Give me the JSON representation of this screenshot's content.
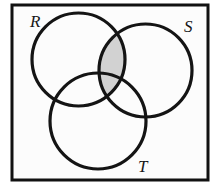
{
  "figure": {
    "kind": "venn-diagram",
    "background_color": "#fcfcfc",
    "frame": {
      "name": "universal-set-rectangle",
      "stroke_color": "#111111",
      "stroke_width": 3,
      "fill_color": "#fcfcfc",
      "x": 12,
      "y": 5,
      "width": 196,
      "height": 175
    },
    "stroke_color": "#141414",
    "stroke_width": 3.2,
    "shade_color": "#d2d2d2",
    "circles": [
      {
        "id": "R",
        "label": "R",
        "cx": 78.5,
        "cy": 59.5,
        "r": 46.5,
        "label_x": 30,
        "label_y": 27,
        "fill": "none"
      },
      {
        "id": "S",
        "label": "S",
        "cx": 145.5,
        "cy": 70.5,
        "r": 46.5,
        "label_x": 184,
        "label_y": 32,
        "fill": "none"
      },
      {
        "id": "T",
        "label": "T",
        "cx": 98.0,
        "cy": 121.0,
        "r": 48.0,
        "label_x": 138,
        "label_y": 172,
        "fill": "none"
      }
    ],
    "shaded_regions": [
      {
        "id": "R-intersect-S",
        "name": "region-r-intersect-s",
        "set_expression": "R ∩ S",
        "color": "#d2d2d2"
      }
    ]
  }
}
